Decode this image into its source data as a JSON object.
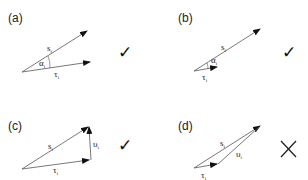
{
  "panels": [
    {
      "id": "a",
      "label": "(a)",
      "vectors": {
        "s": "s",
        "tau": "τ",
        "subscript": "i"
      },
      "angle_label": "α",
      "verdict": "✓",
      "verdict_type": "check"
    },
    {
      "id": "b",
      "label": "(b)",
      "vectors": {
        "s": "s",
        "tau": "τ",
        "subscript": "i"
      },
      "angle_label": "α",
      "verdict": "✓",
      "verdict_type": "check"
    },
    {
      "id": "c",
      "label": "(c)",
      "vectors": {
        "s": "s",
        "tau": "τ",
        "upsilon": "υ",
        "subscript": "i"
      },
      "verdict": "✓",
      "verdict_type": "check"
    },
    {
      "id": "d",
      "label": "(d)",
      "vectors": {
        "s": "s",
        "tau": "τ",
        "upsilon": "υ",
        "subscript": "i"
      },
      "verdict": "✕",
      "verdict_type": "cross"
    }
  ],
  "colors": {
    "line": "#555555",
    "text": "#222222",
    "mark": "#111111"
  }
}
